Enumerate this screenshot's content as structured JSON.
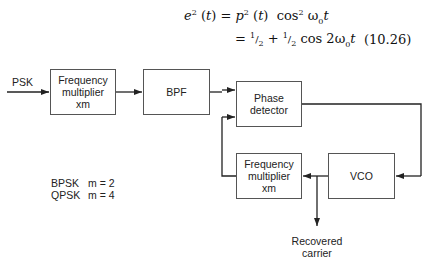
{
  "equation": {
    "line1_lhs": "e² (t) = p² (t)  cos² ω₀t",
    "line2": "= ½ + ½ cos 2ω₀t",
    "number": "(10.26)"
  },
  "diagram": {
    "input_label": "PSK",
    "blocks": [
      {
        "id": "freq-mult-1",
        "lines": [
          "Frequency",
          "multiplier",
          "xm"
        ]
      },
      {
        "id": "bpf",
        "lines": [
          "BPF"
        ]
      },
      {
        "id": "phase-detector",
        "lines": [
          "Phase",
          "detector"
        ]
      },
      {
        "id": "freq-mult-2",
        "lines": [
          "Frequency",
          "multiplier",
          "xm"
        ]
      },
      {
        "id": "vco",
        "lines": [
          "VCO"
        ]
      }
    ],
    "legend": [
      {
        "mod": "BPSK",
        "m": "m = 2"
      },
      {
        "mod": "QPSK",
        "m": "m = 4"
      }
    ],
    "output_label": [
      "Recovered",
      "carrier"
    ]
  }
}
